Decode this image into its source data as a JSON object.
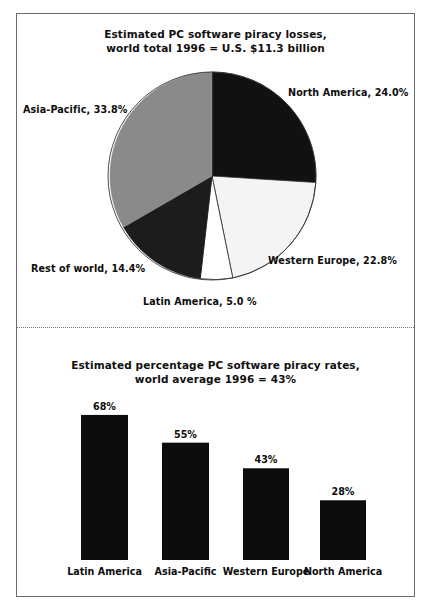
{
  "figure": {
    "background": "#ffffff",
    "frame_color": "#6b6b6b",
    "divider_style": "dotted"
  },
  "pie_chart": {
    "title_line1": "Estimated PC software piracy losses,",
    "title_line2": "world total 1996 = U.S. $11.3 billion",
    "labels": {
      "north_america": "North America, 24.0%",
      "asia_pacific": "Asia-Pacific, 33.8%",
      "rest_of_world": "Rest of world, 14.4%",
      "western_europe": "Western Europe, 22.8%",
      "latin_america": "Latin America, 5.0 %"
    }
  },
  "bar_chart": {
    "title_line1": "Estimated percentage PC software piracy rates,",
    "title_line2": "world average 1996 = 43%"
  },
  "chart_data": [
    {
      "type": "pie",
      "title": "Estimated PC software piracy losses, world total 1996 = U.S. $11.3 billion",
      "unit": "percent of U.S. $11.3 billion",
      "start_angle_deg": 0,
      "direction": "clockwise",
      "legend_position": "outside-labels",
      "slices": [
        {
          "label": "North America",
          "value": 24.0,
          "display": "North America, 24.0%",
          "color": "#111111"
        },
        {
          "label": "Western Europe",
          "value": 22.8,
          "display": "Western Europe, 22.8%",
          "color": "#f2f2f2"
        },
        {
          "label": "Latin America",
          "value": 5.0,
          "display": "Latin America, 5.0 %",
          "color": "#ffffff"
        },
        {
          "label": "Rest of world",
          "value": 14.4,
          "display": "Rest of world, 14.4%",
          "color": "#1c1c1c"
        },
        {
          "label": "Asia-Pacific",
          "value": 33.8,
          "display": "Asia-Pacific, 33.8%",
          "color": "#8a8a8a"
        }
      ]
    },
    {
      "type": "bar",
      "title": "Estimated percentage PC software piracy rates, world average 1996 = 43%",
      "xlabel": "",
      "ylabel": "",
      "ylim": [
        0,
        75
      ],
      "grid": false,
      "legend_position": "none",
      "categories": [
        "Latin America",
        "Asia-Pacific",
        "Western Europe",
        "North America"
      ],
      "values": [
        68,
        55,
        43,
        28
      ],
      "value_labels": [
        "68%",
        "55%",
        "43%",
        "28%"
      ],
      "bar_color": "#0d0d0d"
    }
  ]
}
